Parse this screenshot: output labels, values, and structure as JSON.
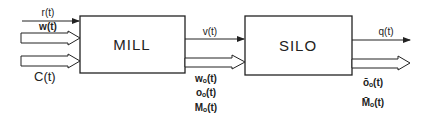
{
  "diagram": {
    "blocks": [
      {
        "id": "mill",
        "label": "MILL"
      },
      {
        "id": "silo",
        "label": "SILO"
      }
    ],
    "inputs_mill": {
      "r": "r(t)",
      "w": "w(t)",
      "c": "C(t)"
    },
    "mill_to_silo": {
      "v": "v(t)",
      "wo": "wₒ(t)",
      "oo": "oₒ(t)",
      "Mo": "Mₒ(t)"
    },
    "silo_outputs": {
      "q": "q(t)",
      "oo_bar": "ōₒ(t)",
      "Mo_bar": "M̄ₒ(t)"
    },
    "colors": {
      "line": "#222222",
      "background": "#ffffff"
    }
  }
}
